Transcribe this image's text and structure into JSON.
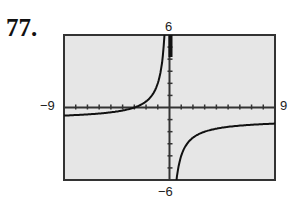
{
  "problem_number": "77.",
  "chart_data": {
    "type": "line",
    "title": "",
    "xlabel": "",
    "ylabel": "",
    "xlim": [
      -9,
      9
    ],
    "ylim": [
      -6,
      6
    ],
    "tick_labels": {
      "xmin": "−9",
      "xmax": "9",
      "ymin": "−6",
      "ymax": "6"
    },
    "grid": false,
    "xscale_ticks": 1,
    "yscale_ticks": 1,
    "asymptotes": {
      "vertical": 0,
      "horizontal": -1
    },
    "series": [
      {
        "name": "left branch",
        "x": [
          -9,
          -7,
          -5,
          -4,
          -3,
          -2,
          -1.5,
          -1,
          -0.75,
          -0.6,
          -0.5
        ],
        "y": [
          -0.67,
          -0.57,
          -0.4,
          -0.25,
          0,
          0.5,
          1,
          2,
          3,
          4,
          5
        ]
      },
      {
        "name": "right branch",
        "x": [
          0.5,
          0.6,
          0.75,
          1,
          1.5,
          2,
          3,
          4,
          5,
          7,
          9
        ],
        "y": [
          -7,
          -6,
          -5,
          -4,
          -3,
          -2.5,
          -2,
          -1.75,
          -1.6,
          -1.43,
          -1.33
        ]
      }
    ],
    "colors": {
      "background": "#e6e6e6",
      "frame": "#333333",
      "curve": "#111111"
    }
  }
}
